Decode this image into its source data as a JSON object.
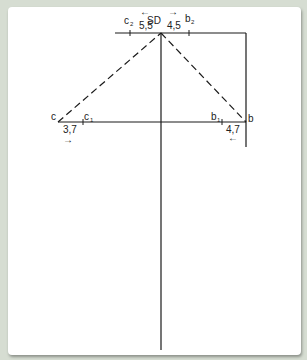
{
  "diagram": {
    "points": {
      "apex": "SD",
      "left": "c",
      "right": "b",
      "left_inner": "c",
      "left_inner_sub": "1",
      "right_inner": "b",
      "right_inner_sub": "1",
      "top_left": "c",
      "top_left_sub": "2",
      "top_right": "b",
      "top_right_sub": "2"
    },
    "dimensions": {
      "top_left": "5,5",
      "top_right": "4,5",
      "bottom_left": "3,7",
      "bottom_right": "4,7"
    },
    "arrows": {
      "top_left": "←",
      "top_right": "→",
      "bottom_left": "→",
      "bottom_right": "←"
    },
    "colors": {
      "line": "#1a1a1a",
      "background": "#d6ddd2",
      "card": "#ffffff"
    }
  }
}
